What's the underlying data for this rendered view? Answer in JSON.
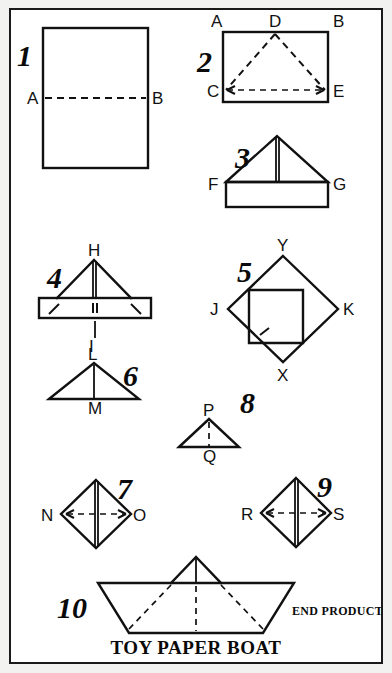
{
  "page": {
    "title": "TOY PAPER BOAT",
    "end_product_label": "END PRODUCT",
    "background_color": "#f2f2f0",
    "paper_color": "#ffffff",
    "ink_color": "#111111"
  },
  "steps": [
    {
      "number": "1",
      "shape": "rectangle with horizontal fold line",
      "points": [
        {
          "name": "A",
          "label": "A"
        },
        {
          "name": "B",
          "label": "B"
        }
      ]
    },
    {
      "number": "2",
      "shape": "rectangle with dashed triangle fold lines",
      "points": [
        {
          "name": "A",
          "label": "A"
        },
        {
          "name": "B",
          "label": "B"
        },
        {
          "name": "C",
          "label": "C"
        },
        {
          "name": "D",
          "label": "D"
        },
        {
          "name": "E",
          "label": "E"
        }
      ]
    },
    {
      "number": "3",
      "shape": "triangle over rectangular band",
      "points": [
        {
          "name": "F",
          "label": "F"
        },
        {
          "name": "G",
          "label": "G"
        }
      ]
    },
    {
      "number": "4",
      "shape": "triangle with folded band and tuck marks",
      "points": [
        {
          "name": "H",
          "label": "H"
        },
        {
          "name": "I",
          "label": "I"
        }
      ]
    },
    {
      "number": "5",
      "shape": "diamond square with inner flap",
      "points": [
        {
          "name": "Y",
          "label": "Y"
        },
        {
          "name": "J",
          "label": "J"
        },
        {
          "name": "K",
          "label": "K"
        },
        {
          "name": "X",
          "label": "X"
        }
      ]
    },
    {
      "number": "6",
      "shape": "triangle with vertical centre line",
      "points": [
        {
          "name": "L",
          "label": "L"
        },
        {
          "name": "M",
          "label": "M"
        }
      ]
    },
    {
      "number": "7",
      "shape": "diamond with horizontal pull arrows",
      "points": [
        {
          "name": "N",
          "label": "N"
        },
        {
          "name": "O",
          "label": "O"
        }
      ]
    },
    {
      "number": "8",
      "shape": "small triangle with dashed centre line",
      "points": [
        {
          "name": "P",
          "label": "P"
        },
        {
          "name": "Q",
          "label": "Q"
        }
      ]
    },
    {
      "number": "9",
      "shape": "diamond with horizontal pull arrows",
      "points": [
        {
          "name": "R",
          "label": "R"
        },
        {
          "name": "S",
          "label": "S"
        }
      ]
    },
    {
      "number": "10",
      "shape": "finished paper boat",
      "points": []
    }
  ]
}
